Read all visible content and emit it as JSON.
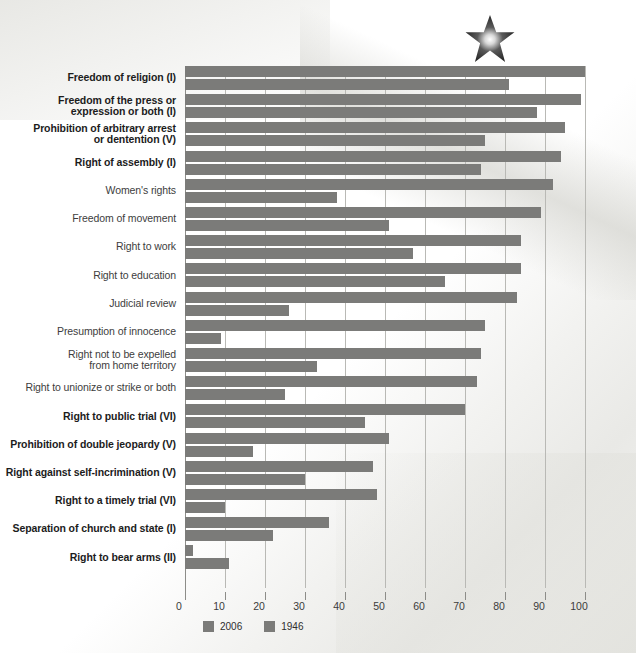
{
  "chart_data": {
    "type": "bar",
    "orientation": "horizontal",
    "title": "",
    "xlabel": "",
    "ylabel": "",
    "xlim": [
      0,
      100
    ],
    "xticks": [
      0,
      10,
      20,
      30,
      40,
      50,
      60,
      70,
      80,
      90,
      100
    ],
    "grid": true,
    "legend_position": "bottom-left",
    "series_colors": {
      "2006": "#7b7b79",
      "1946": "#7b7b79"
    },
    "categories": [
      "Freedom of religion (I)",
      "Freedom of the press or expression or both (I)",
      "Prohibition of arbitrary arrest or dentention (V)",
      "Right of assembly (I)",
      "Women's rights",
      "Freedom of movement",
      "Right to work",
      "Right to education",
      "Judicial review",
      "Presumption of innocence",
      "Right not to be expelled from home territory",
      "Right to unionize or strike or both",
      "Right to public trial (VI)",
      "Prohibition of double jeopardy (V)",
      "Right against self-incrimination (V)",
      "Right to a timely trial (VI)",
      "Separation of church and state (I)",
      "Right to bear arms (II)"
    ],
    "series": [
      {
        "name": "2006",
        "values": [
          100,
          99,
          95,
          94,
          92,
          89,
          84,
          84,
          83,
          75,
          74,
          73,
          70,
          51,
          47,
          48,
          36,
          2
        ]
      },
      {
        "name": "1946",
        "values": [
          81,
          88,
          75,
          74,
          38,
          51,
          57,
          65,
          26,
          9,
          33,
          25,
          45,
          17,
          30,
          10,
          22,
          11
        ]
      }
    ]
  },
  "axis": {
    "ticks": [
      "0",
      "10",
      "20",
      "30",
      "40",
      "50",
      "60",
      "70",
      "80",
      "90",
      "100"
    ]
  },
  "legend": {
    "items": [
      {
        "label": "2006"
      },
      {
        "label": "1946"
      }
    ]
  },
  "labels": {
    "bold_flags": [
      true,
      true,
      true,
      true,
      false,
      false,
      false,
      false,
      false,
      false,
      false,
      false,
      true,
      true,
      true,
      true,
      true,
      true
    ],
    "lines": [
      [
        "Freedom of religion (I)"
      ],
      [
        "Freedom of the press or",
        "expression or both (I)"
      ],
      [
        "Prohibition of arbitrary arrest",
        "or dentention (V)"
      ],
      [
        "Right of assembly (I)"
      ],
      [
        "Women's rights"
      ],
      [
        "Freedom of movement"
      ],
      [
        "Right to work"
      ],
      [
        "Right to education"
      ],
      [
        "Judicial review"
      ],
      [
        "Presumption of innocence"
      ],
      [
        "Right not to be expelled",
        "from home territory"
      ],
      [
        "Right to unionize or strike or both"
      ],
      [
        "Right to public trial (VI)"
      ],
      [
        "Prohibition of double jeopardy (V)"
      ],
      [
        "Right against self-incrimination (V)"
      ],
      [
        "Right to a timely trial (VI)"
      ],
      [
        "Separation of church and state (I)"
      ],
      [
        "Right to bear arms (II)"
      ]
    ]
  },
  "decoration": {
    "star": "star-icon"
  }
}
